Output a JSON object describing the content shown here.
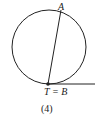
{
  "figure": {
    "caption": "(4)",
    "labels": {
      "point_a": "A",
      "point_tb": "T = B"
    },
    "colors": {
      "stroke": "#222222",
      "background": "#ffffff"
    }
  }
}
